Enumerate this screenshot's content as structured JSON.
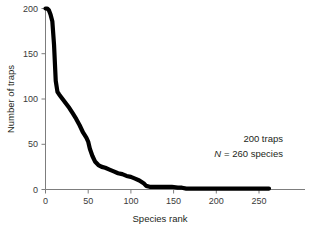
{
  "chart_data": {
    "type": "line",
    "title": "",
    "xlabel": "Species rank",
    "ylabel": "Number of traps",
    "xlim": [
      0,
      262
    ],
    "ylim": [
      0,
      200
    ],
    "grid": false,
    "legend": "none",
    "xticks": [
      0,
      50,
      100,
      150,
      200,
      250
    ],
    "yticks": [
      0,
      50,
      100,
      150,
      200
    ],
    "xtick_labels": [
      "0",
      "50",
      "100",
      "150",
      "200",
      "250"
    ],
    "ytick_labels": [
      "0",
      "50",
      "100",
      "150",
      "200"
    ],
    "annotations": [
      {
        "text": "200 traps",
        "italic_prefix": ""
      },
      {
        "text": "= 260 species",
        "italic_prefix": "N"
      }
    ],
    "series": [
      {
        "name": "Number of traps per species rank",
        "x": [
          0,
          2,
          4,
          6,
          8,
          10,
          12,
          14,
          16,
          20,
          24,
          28,
          32,
          36,
          40,
          44,
          48,
          50,
          52,
          55,
          58,
          62,
          66,
          70,
          75,
          80,
          85,
          90,
          95,
          100,
          105,
          110,
          115,
          118,
          122,
          126,
          132,
          140,
          148,
          155,
          160,
          165,
          170,
          180,
          190,
          200,
          215,
          230,
          245,
          262
        ],
        "y": [
          200,
          200,
          198,
          193,
          186,
          160,
          120,
          108,
          105,
          100,
          95,
          90,
          84,
          78,
          71,
          63,
          57,
          53,
          45,
          37,
          31,
          27,
          25,
          24,
          22,
          20,
          18,
          17,
          15,
          14,
          12,
          10,
          7,
          4,
          3,
          3,
          3,
          3,
          3,
          2,
          2,
          1,
          1,
          1,
          1,
          1,
          1,
          1,
          1,
          1
        ]
      }
    ]
  },
  "annotation_line1": "200 traps",
  "annotation_line2_italic": "N",
  "annotation_line2_rest": "= 260 species"
}
